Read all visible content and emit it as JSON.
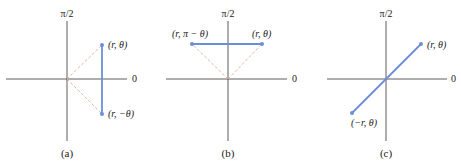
{
  "colors": {
    "axis": "#333333",
    "segment": "#6a8fd8",
    "dashed": "#e8a8a0",
    "point": "#6a8fd8"
  },
  "panels": [
    {
      "id": "a",
      "caption": "(a)",
      "axis_top_label": "π/2",
      "axis_right_label": "0",
      "origin": [
        67,
        79
      ],
      "points": [
        {
          "label": "(r, θ)",
          "x": 102,
          "y": 45
        },
        {
          "label": "(r, −θ)",
          "x": 102,
          "y": 114
        }
      ],
      "description": "Symmetry about the polar axis"
    },
    {
      "id": "b",
      "caption": "(b)",
      "axis_top_label": "π/2",
      "axis_right_label": "0",
      "origin": [
        228,
        79
      ],
      "points": [
        {
          "label": "(r, π − θ)",
          "x": 192,
          "y": 44
        },
        {
          "label": "(r, θ)",
          "x": 262,
          "y": 44
        }
      ],
      "description": "Symmetry about the line θ = π/2"
    },
    {
      "id": "c",
      "caption": "(c)",
      "axis_top_label": "π/2",
      "axis_right_label": "0",
      "origin": [
        386,
        79
      ],
      "points": [
        {
          "label": "(r, θ)",
          "x": 421,
          "y": 44
        },
        {
          "label": "(−r, θ)",
          "x": 352,
          "y": 113
        }
      ],
      "description": "Symmetry about the pole"
    }
  ]
}
